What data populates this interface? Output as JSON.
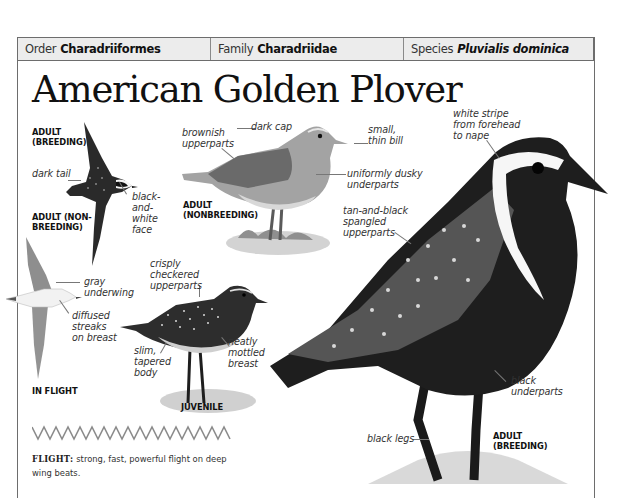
{
  "header": {
    "order_key": "Order",
    "order_value": "Charadriiformes",
    "family_key": "Family",
    "family_value": "Charadriidae",
    "species_key": "Species",
    "species_value": "Pluvialis dominica"
  },
  "title": "American Golden Plover",
  "plates": {
    "flying_breeding": {
      "label": "ADULT\n(BREEDING)",
      "captions": [
        "dark tail",
        "black-\nand-\nwhite\nface"
      ]
    },
    "flying_nonbreeding": {
      "label": "ADULT (NON-\nBREEDING)",
      "captions": [
        "gray\nunderwing",
        "diffused\nstreaks\non breast"
      ]
    },
    "in_flight_label": "IN FLIGHT",
    "adult_nonbreeding": {
      "label": "ADULT\n(NONBREEDING)",
      "captions": [
        "brownish\nupperparts",
        "dark cap",
        "small,\nthin bill",
        "uniformly dusky\nunderparts"
      ]
    },
    "juvenile": {
      "label": "JUVENILE",
      "captions": [
        "crisply\ncheckered\nupperparts",
        "slim,\ntapered\nbody",
        "neatly\nmottled\nbreast"
      ]
    },
    "adult_breeding": {
      "label": "ADULT\n(BREEDING)",
      "captions": [
        "white stripe\nfrom forehead\nto nape",
        "tan-and-black\nspangled\nupperparts",
        "black\nunderparts",
        "black legs"
      ]
    }
  },
  "flight": {
    "heading": "FLIGHT:",
    "text": "strong, fast, powerful flight on deep wing beats."
  },
  "colors": {
    "frame": "#6d6d6d",
    "header_bg": "#ececec",
    "text": "#231f20",
    "caption": "#333333"
  }
}
